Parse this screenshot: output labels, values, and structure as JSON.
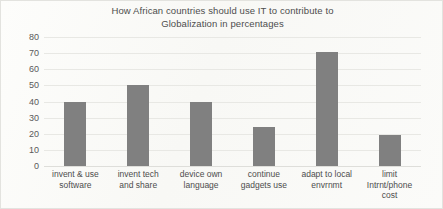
{
  "chart_data": {
    "type": "bar",
    "title": "How African countries should use IT to contribute to Globalization in percentages",
    "title_line1": "How African countries should use IT to contribute to",
    "title_line2": "Globalization in percentages",
    "xlabel": "",
    "ylabel": "",
    "ylim": [
      0,
      80
    ],
    "ytick_step": 10,
    "yticks": [
      80,
      70,
      60,
      50,
      40,
      30,
      20,
      10,
      0
    ],
    "grid": true,
    "legend": false,
    "bar_color": "#808080",
    "categories": [
      "invent & use software",
      "invent tech and share",
      "device own language",
      "continue gadgets use",
      "adapt to local envrnmt",
      "limit Intrnt/phone cost"
    ],
    "category_lines": [
      [
        "invent & use",
        "software"
      ],
      [
        "invent tech",
        "and share"
      ],
      [
        "device own",
        "language"
      ],
      [
        "continue",
        "gadgets use"
      ],
      [
        "adapt to local",
        "envrnmt"
      ],
      [
        "limit",
        "Intrnt/phone",
        "cost"
      ]
    ],
    "values": [
      40,
      50,
      40,
      24,
      71,
      19
    ]
  }
}
